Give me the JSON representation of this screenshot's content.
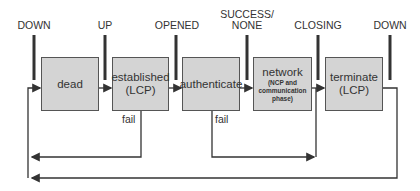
{
  "events": [
    {
      "id": "down-1",
      "label": "DOWN",
      "x": 34
    },
    {
      "id": "up",
      "label": "UP",
      "x": 105
    },
    {
      "id": "opened",
      "label": "OPENED",
      "x": 177
    },
    {
      "id": "success-none",
      "label": "SUCCESS/\nNONE",
      "x": 247
    },
    {
      "id": "closing",
      "label": "CLOSING",
      "x": 318
    },
    {
      "id": "down-2",
      "label": "DOWN",
      "x": 390
    }
  ],
  "states": [
    {
      "id": "dead",
      "label": "dead",
      "sub": ""
    },
    {
      "id": "established",
      "label": "established\n(LCP)",
      "sub": ""
    },
    {
      "id": "authenticate",
      "label": "authenticate",
      "sub": ""
    },
    {
      "id": "network",
      "label": "network",
      "sub": "(NCP and\ncommunication\nphase)"
    },
    {
      "id": "terminate",
      "label": "terminate\n(LCP)",
      "sub": ""
    }
  ],
  "transitions": {
    "fail_established": "fail",
    "fail_authenticate": "fail"
  },
  "colors": {
    "box_fill": "#d4d4d4",
    "box_border": "#555555",
    "line": "#333333"
  }
}
